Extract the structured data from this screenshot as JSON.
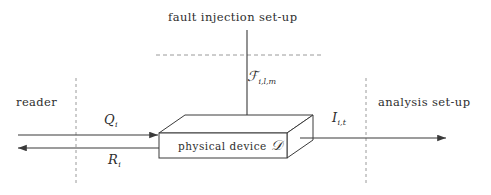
{
  "figure": {
    "title": "fault injection set-up",
    "background_color": "#ffffff",
    "stroke_color": "#3a3a3a",
    "dashed_color": "#8a8a8a"
  },
  "labels": {
    "reader": "reader",
    "analysis_setup": "analysis set-up",
    "device": "physical device",
    "device_symbol": "𝒟",
    "fault_symbol": "ℱ",
    "fault_subscript": "i,l,m",
    "query_symbol": "Q",
    "query_subscript": "i",
    "response_symbol": "R",
    "response_subscript": "i",
    "observation_symbol": "I",
    "observation_subscript": "i,t"
  },
  "elements": {
    "vertical_arrow": "fault-injection-arrow",
    "query_arrow": "query-arrow",
    "response_arrow": "response-arrow",
    "observation_arrow": "observation-arrow",
    "boundary_left": "reader-boundary",
    "boundary_right": "analysis-boundary",
    "boundary_top": "fault-setup-boundary",
    "device_box": "physical-device-box"
  }
}
